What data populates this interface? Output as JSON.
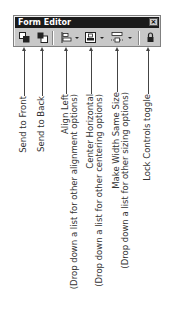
{
  "window": {
    "title": "Form Editor",
    "close_label": "×"
  },
  "toolbar": {
    "buttons": [
      {
        "name": "send-to-front",
        "icon": "send-to-front-icon"
      },
      {
        "name": "send-to-back",
        "icon": "send-to-back-icon"
      },
      {
        "name": "align-left",
        "icon": "align-left-icon",
        "dropdown": true
      },
      {
        "name": "center-horizontal",
        "icon": "center-horizontal-icon",
        "dropdown": true
      },
      {
        "name": "make-width-same-size",
        "icon": "make-width-same-size-icon",
        "dropdown": true
      },
      {
        "name": "lock-controls",
        "icon": "lock-icon"
      }
    ]
  },
  "callouts": [
    {
      "lines": [
        "Send to Front"
      ]
    },
    {
      "lines": [
        "Send to Back"
      ]
    },
    {
      "lines": [
        "Align Left",
        "(Drop down a list for other alignment options)"
      ]
    },
    {
      "lines": [
        "Center Horizontal",
        "(Drop down a list for other centering options)"
      ]
    },
    {
      "lines": [
        "Make Width Same Size",
        "(Drop down a list for other sizing options)"
      ]
    },
    {
      "lines": [
        "Lock Controls toggle"
      ]
    }
  ],
  "labels": {
    "c0l0": "Send to Front",
    "c1l0": "Send to Back",
    "c2l0": "Align Left",
    "c2l1": "(Drop down a list for other alignment options)",
    "c3l0": "Center Horizontal",
    "c3l1": "(Drop down a list for other centering options)",
    "c4l0": "Make Width Same Size",
    "c4l1": "(Drop down a list for other sizing options)",
    "c5l0": "Lock Controls toggle"
  }
}
